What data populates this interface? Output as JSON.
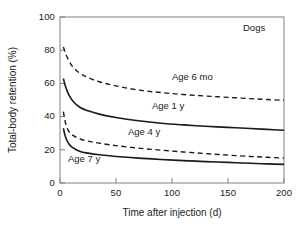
{
  "chart_data": {
    "type": "line",
    "title": "",
    "panel_label": "Dogs",
    "xlabel": "Time after injection (d)",
    "ylabel": "Total-body retention (%)",
    "xlim": [
      0,
      200
    ],
    "ylim": [
      0,
      100
    ],
    "xticks": [
      0,
      50,
      100,
      150,
      200
    ],
    "yticks": [
      0,
      20,
      40,
      60,
      80,
      100
    ],
    "xticklabels": [
      "0",
      "50",
      "100",
      "150",
      "200"
    ],
    "yticklabels": [
      "0",
      "20",
      "40",
      "60",
      "80",
      "100"
    ],
    "grid": false,
    "legend_position": "inline-annotations",
    "x": [
      3,
      5,
      8,
      12,
      18,
      25,
      35,
      50,
      70,
      90,
      110,
      130,
      150,
      170,
      185,
      200
    ],
    "series": [
      {
        "name": "Age 6 mo",
        "label": "Age 6 mo",
        "linestyle": "dashed",
        "color": "#1a1a1a",
        "values": [
          82,
          78,
          73.5,
          69.5,
          66,
          63.5,
          61,
          58.5,
          56,
          54.5,
          53.3,
          52.4,
          51.6,
          50.8,
          50.3,
          49.8
        ]
      },
      {
        "name": "Age 1 y",
        "label": "Age 1 y",
        "linestyle": "solid",
        "color": "#1a1a1a",
        "values": [
          63,
          58,
          53,
          49,
          45.5,
          43.5,
          41.5,
          39.5,
          37.5,
          36,
          35,
          34.2,
          33.5,
          32.8,
          32.3,
          31.8
        ]
      },
      {
        "name": "Age 4 y",
        "label": "Age 4 y",
        "linestyle": "dashed",
        "color": "#1a1a1a",
        "values": [
          43,
          36,
          31,
          28.5,
          26.5,
          25.2,
          24,
          22.5,
          21,
          19.8,
          18.7,
          17.7,
          16.8,
          16,
          15.5,
          15.0
        ]
      },
      {
        "name": "Age 7 y",
        "label": "Age 7 y",
        "linestyle": "solid",
        "color": "#1a1a1a",
        "values": [
          33,
          27.5,
          23.5,
          21,
          19,
          18,
          17,
          16,
          15,
          14.2,
          13.5,
          12.9,
          12.4,
          11.9,
          11.5,
          11.2
        ]
      }
    ],
    "annotations": [
      {
        "text": "Dogs",
        "x_px": 258,
        "y_px": 27
      },
      {
        "text": "Age 6 mo",
        "x_px": 172,
        "y_px": 77
      },
      {
        "text": "Age 1 y",
        "x_px": 152,
        "y_px": 106
      },
      {
        "text": "Age 4 y",
        "x_px": 128,
        "y_px": 131
      },
      {
        "text": "Age 7 y",
        "x_px": 73,
        "y_px": 159
      }
    ]
  }
}
